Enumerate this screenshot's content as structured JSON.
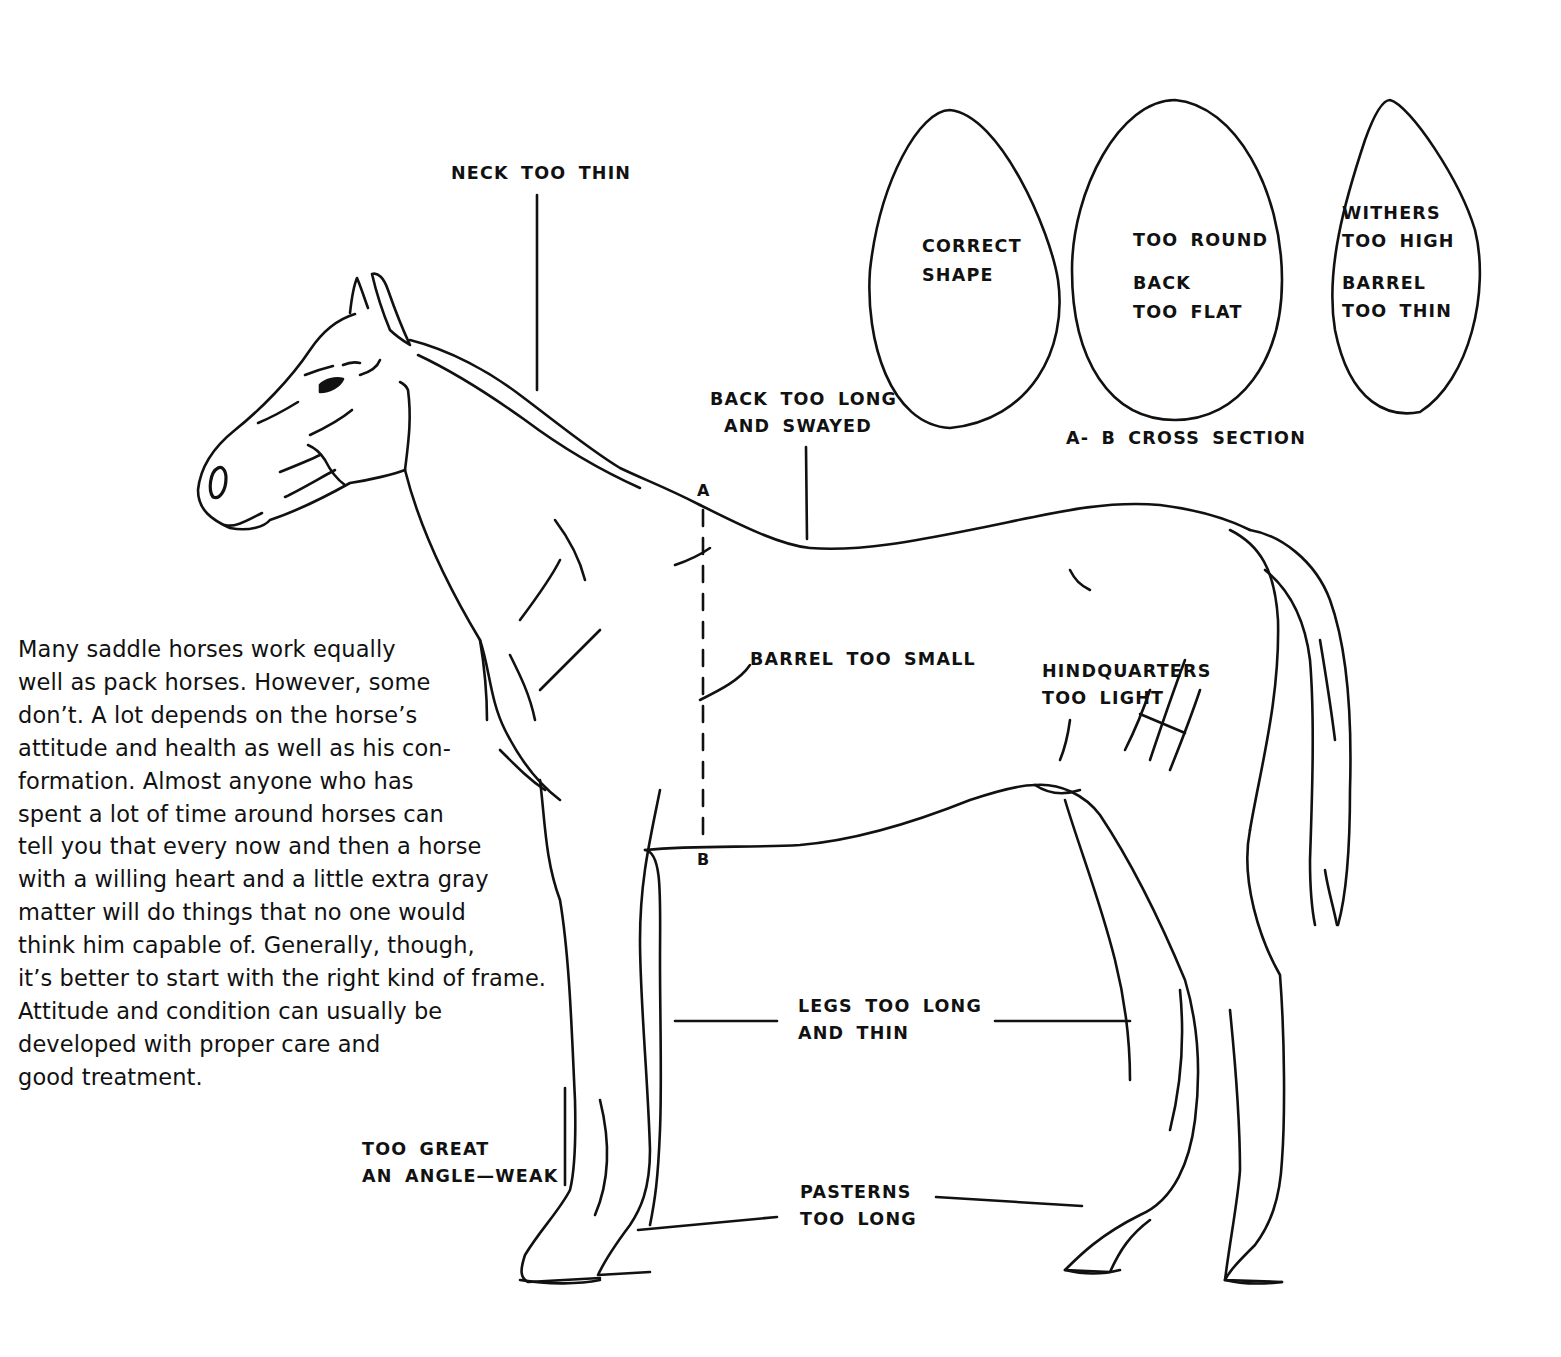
{
  "diagram": {
    "colors": {
      "ink": "#111111",
      "paper": "#ffffff"
    },
    "callouts": [
      {
        "id": "neck",
        "lines": [
          "NECK TOO THIN"
        ]
      },
      {
        "id": "back",
        "lines": [
          "BACK TOO LONG",
          "AND SWAYED"
        ]
      },
      {
        "id": "barrel",
        "lines": [
          "BARREL TOO SMALL"
        ]
      },
      {
        "id": "hindquarters",
        "lines": [
          "HINDQUARTERS",
          "TOO LIGHT"
        ]
      },
      {
        "id": "legs",
        "lines": [
          "LEGS TOO LONG",
          "AND THIN"
        ]
      },
      {
        "id": "angle",
        "lines": [
          "TOO GREAT",
          "AN ANGLE—WEAK"
        ]
      },
      {
        "id": "pasterns",
        "lines": [
          "PASTERNS",
          "TOO LONG"
        ]
      }
    ],
    "section_markers": {
      "top": "A",
      "bottom": "B"
    },
    "cross_section": {
      "caption": "A- B CROSS SECTION",
      "shapes": [
        {
          "id": "correct",
          "lines": [
            "CORRECT",
            "SHAPE"
          ]
        },
        {
          "id": "round",
          "lines": [
            "TOO ROUND",
            "BACK",
            "TOO FLAT"
          ]
        },
        {
          "id": "thin",
          "lines": [
            "WITHERS",
            "TOO HIGH",
            "BARREL",
            "TOO THIN"
          ]
        }
      ]
    },
    "paragraph_lines": [
      "Many saddle horses work equally",
      "well as pack horses. However, some",
      "don’t. A lot depends on the horse’s",
      "attitude and health as well as his con-",
      "formation. Almost anyone who has",
      "spent a lot of time around horses can",
      "tell you that every now and then a horse",
      "with a willing heart and a little extra gray",
      "matter will do things that no one would",
      "think him capable of. Generally, though,",
      "it’s better to start with the right kind of frame.",
      "Attitude and condition can usually be",
      "developed with proper care and",
      "good treatment."
    ]
  }
}
